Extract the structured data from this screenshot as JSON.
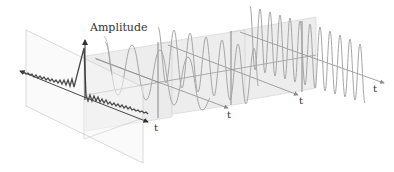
{
  "diagram": {
    "title_label": "Amplitude",
    "axis_label": "t",
    "colors": {
      "signal": "#4a4a4a",
      "sinusoid": "#a6a6a6",
      "plane_fill": "#e9e9e9",
      "plane_edge": "#c8c8c8",
      "axis": "#8c8c8c",
      "front_plane_edge": "#d0d0d0"
    },
    "planes": [
      {
        "name": "time-domain-signal",
        "axis_label": "t",
        "kind": "composite"
      },
      {
        "name": "component-1",
        "axis_label": "t",
        "kind": "sinusoid"
      },
      {
        "name": "component-2",
        "axis_label": "t",
        "kind": "sinusoid"
      },
      {
        "name": "component-3",
        "axis_label": "t",
        "kind": "sinusoid"
      }
    ]
  }
}
